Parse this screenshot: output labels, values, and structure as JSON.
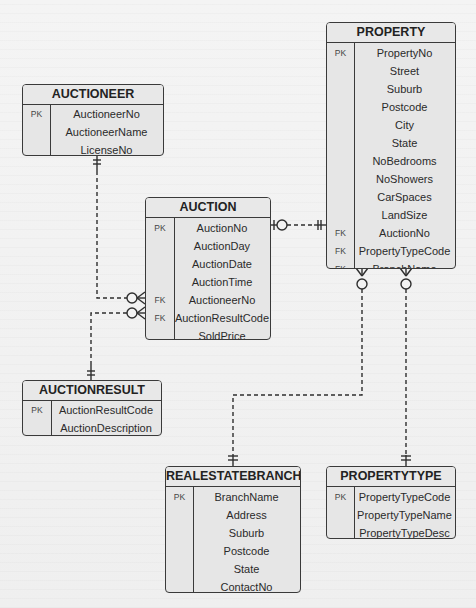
{
  "diagram": {
    "type": "crows-foot-erd",
    "colors": {
      "background": "#f3f3f3",
      "entity_fill": "#e6e6e6",
      "stroke": "#3a3a3a",
      "text": "#222222"
    }
  },
  "entities": {
    "auctioneer": {
      "title": "AUCTIONEER",
      "rows": [
        {
          "key": "PK",
          "attr": "AuctioneerNo"
        },
        {
          "key": "",
          "attr": "AuctioneerName"
        },
        {
          "key": "",
          "attr": "LicenseNo"
        }
      ]
    },
    "property": {
      "title": "PROPERTY",
      "rows": [
        {
          "key": "PK",
          "attr": "PropertyNo"
        },
        {
          "key": "",
          "attr": "Street"
        },
        {
          "key": "",
          "attr": "Suburb"
        },
        {
          "key": "",
          "attr": "Postcode"
        },
        {
          "key": "",
          "attr": "City"
        },
        {
          "key": "",
          "attr": "State"
        },
        {
          "key": "",
          "attr": "NoBedrooms"
        },
        {
          "key": "",
          "attr": "NoShowers"
        },
        {
          "key": "",
          "attr": "CarSpaces"
        },
        {
          "key": "",
          "attr": "LandSize"
        },
        {
          "key": "FK",
          "attr": "AuctionNo"
        },
        {
          "key": "FK",
          "attr": "PropertyTypeCode"
        },
        {
          "key": "FK",
          "attr": "BranchName"
        }
      ]
    },
    "auction": {
      "title": "AUCTION",
      "rows": [
        {
          "key": "PK",
          "attr": "AuctionNo"
        },
        {
          "key": "",
          "attr": "AuctionDay"
        },
        {
          "key": "",
          "attr": "AuctionDate"
        },
        {
          "key": "",
          "attr": "AuctionTime"
        },
        {
          "key": "FK",
          "attr": "AuctioneerNo"
        },
        {
          "key": "FK",
          "attr": "AuctionResultCode"
        },
        {
          "key": "",
          "attr": "SoldPrice"
        }
      ]
    },
    "auctionresult": {
      "title": "AUCTIONRESULT",
      "rows": [
        {
          "key": "PK",
          "attr": "AuctionResultCode"
        },
        {
          "key": "",
          "attr": "AuctionDescription"
        }
      ]
    },
    "realestatebranch": {
      "title": "REALESTATEBRANCH",
      "rows": [
        {
          "key": "PK",
          "attr": "BranchName"
        },
        {
          "key": "",
          "attr": "Address"
        },
        {
          "key": "",
          "attr": "Suburb"
        },
        {
          "key": "",
          "attr": "Postcode"
        },
        {
          "key": "",
          "attr": "State"
        },
        {
          "key": "",
          "attr": "ContactNo"
        }
      ]
    },
    "propertytype": {
      "title": "PROPERTYTYPE",
      "rows": [
        {
          "key": "PK",
          "attr": "PropertyTypeCode"
        },
        {
          "key": "",
          "attr": "PropertyTypeName"
        },
        {
          "key": "",
          "attr": "PropertyTypeDesc"
        }
      ]
    }
  },
  "relationships": [
    {
      "from": "AUCTIONEER",
      "from_cardinality": "one-and-only-one",
      "to": "AUCTION",
      "to_cardinality": "zero-or-many"
    },
    {
      "from": "AUCTIONRESULT",
      "from_cardinality": "one-and-only-one",
      "to": "AUCTION",
      "to_cardinality": "zero-or-many"
    },
    {
      "from": "AUCTION",
      "from_cardinality": "zero-or-one",
      "to": "PROPERTY",
      "to_cardinality": "one-and-only-one"
    },
    {
      "from": "REALESTATEBRANCH",
      "from_cardinality": "one-and-only-one",
      "to": "PROPERTY",
      "to_cardinality": "zero-or-many"
    },
    {
      "from": "PROPERTYTYPE",
      "from_cardinality": "one-and-only-one",
      "to": "PROPERTY",
      "to_cardinality": "zero-or-many"
    }
  ]
}
